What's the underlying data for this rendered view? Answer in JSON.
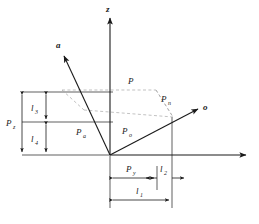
{
  "figure": {
    "type": "vector-decomposition-diagram",
    "background_color": "#ffffff",
    "line_color": "#1a1a1a",
    "dashed_color": "#9a9a9a",
    "width": 259,
    "height": 224
  },
  "axes": [
    {
      "id": "z",
      "label": "z",
      "subscript": "",
      "direction": "up",
      "tip": {
        "x": 110,
        "y": 16
      }
    },
    {
      "id": "a",
      "label": "a",
      "subscript": "",
      "direction": "up-left",
      "tip": {
        "x": 62,
        "y": 53
      }
    },
    {
      "id": "o",
      "label": "o",
      "subscript": "",
      "direction": "up-right",
      "tip": {
        "x": 200,
        "y": 108
      }
    },
    {
      "id": "horizontal",
      "label": "",
      "subscript": "",
      "direction": "right",
      "tip": {
        "x": 248,
        "y": 155
      }
    }
  ],
  "points": [
    {
      "id": "origin",
      "label": "",
      "x": 110,
      "y": 155
    },
    {
      "id": "P",
      "label": "P",
      "subscript": "",
      "x": 130,
      "y": 85
    }
  ],
  "vectors": [
    {
      "id": "Pa",
      "label": "P",
      "subscript": "a",
      "label_x": 79,
      "label_y": 133,
      "from": {
        "x": 110,
        "y": 155
      },
      "to": {
        "x": 66,
        "y": 58
      }
    },
    {
      "id": "Po",
      "label": "P",
      "subscript": "o",
      "label_x": 124,
      "label_y": 133,
      "from": {
        "x": 110,
        "y": 155
      },
      "to": {
        "x": 196,
        "y": 110
      }
    },
    {
      "id": "Pn",
      "label": "P",
      "subscript": "n",
      "label_x": 163,
      "label_y": 101,
      "from": {
        "x": 156,
        "y": 90
      },
      "to": {
        "x": 172,
        "y": 117
      }
    }
  ],
  "dimensions_vertical": [
    {
      "id": "Pz",
      "label": "P",
      "subscript": "z",
      "label_x": 9,
      "label_y": 127,
      "x": 22,
      "y_top": 92,
      "y_bottom": 155
    },
    {
      "id": "l3",
      "label": "l",
      "subscript": "3",
      "label_x": 31,
      "label_y": 110,
      "x": 46,
      "y_top": 92,
      "y_bottom": 122
    },
    {
      "id": "l4",
      "label": "l",
      "subscript": "4",
      "label_x": 31,
      "label_y": 141,
      "x": 46,
      "y_top": 122,
      "y_bottom": 155
    }
  ],
  "dimensions_horizontal": [
    {
      "id": "Py",
      "label": "P",
      "subscript": "y",
      "label_x": 129,
      "label_y": 171,
      "y": 178,
      "x_left": 110,
      "x_right": 157
    },
    {
      "id": "l2",
      "label": "l",
      "subscript": "2",
      "label_x": 163,
      "label_y": 171,
      "y": 178,
      "x_left": 157,
      "x_right": 172
    },
    {
      "id": "l1",
      "label": "l",
      "subscript": "1",
      "label_x": 137,
      "label_y": 193,
      "y": 200,
      "x_left": 110,
      "x_right": 172
    }
  ],
  "extension_lines": [
    {
      "id": "ext-top",
      "x1": 22,
      "y1": 92,
      "x2": 113,
      "y2": 92
    },
    {
      "id": "ext-mid",
      "x1": 22,
      "y1": 122,
      "x2": 113,
      "y2": 122
    },
    {
      "id": "ext-baseline",
      "x1": 22,
      "y1": 155,
      "x2": 110,
      "y2": 155
    },
    {
      "id": "ext-vert-py",
      "x1": 157,
      "y1": 168,
      "x2": 157,
      "y2": 188
    },
    {
      "id": "ext-vert-l1",
      "x1": 172,
      "y1": 117,
      "x2": 172,
      "y2": 208
    },
    {
      "id": "ext-vert-origin",
      "x1": 110,
      "y1": 155,
      "x2": 110,
      "y2": 208
    }
  ],
  "dashed_construction": [
    {
      "id": "dash-P-to-left",
      "x1": 130,
      "y1": 90,
      "x2": 62,
      "y2": 90
    },
    {
      "id": "dash-P-to-Pn",
      "x1": 130,
      "y1": 90,
      "x2": 156,
      "y2": 90
    },
    {
      "id": "dash-Pn-down",
      "x1": 156,
      "y1": 90,
      "x2": 172,
      "y2": 117
    },
    {
      "id": "dash-diag-left",
      "x1": 85,
      "y1": 110,
      "x2": 172,
      "y2": 117
    },
    {
      "id": "dash-left-edge",
      "x1": 62,
      "y1": 90,
      "x2": 85,
      "y2": 110
    }
  ]
}
